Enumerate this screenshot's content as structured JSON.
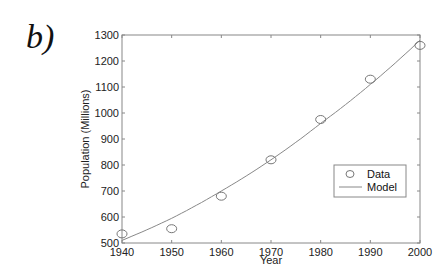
{
  "panel_label": "b)",
  "chart_data": {
    "type": "scatter",
    "title": "",
    "xlabel": "Year",
    "ylabel": "Population (Millions)",
    "xlim": [
      1940,
      2000
    ],
    "ylim": [
      500,
      1300
    ],
    "xticks": [
      1940,
      1950,
      1960,
      1970,
      1980,
      1990,
      2000
    ],
    "yticks": [
      500,
      600,
      700,
      800,
      900,
      1000,
      1100,
      1200,
      1300
    ],
    "grid": false,
    "legend_position": "lower right",
    "series": [
      {
        "name": "Data",
        "type": "scatter",
        "marker": "open-circle",
        "x": [
          1940,
          1950,
          1960,
          1970,
          1980,
          1990,
          2000
        ],
        "values": [
          535,
          555,
          680,
          820,
          975,
          1130,
          1260
        ]
      },
      {
        "name": "Model",
        "type": "line",
        "x": [
          1940,
          1950,
          1960,
          1970,
          1980,
          1990,
          2000
        ],
        "values": [
          510,
          595,
          700,
          820,
          960,
          1110,
          1280
        ]
      }
    ]
  },
  "legend": {
    "items": [
      {
        "label": "Data",
        "symbol": "circle"
      },
      {
        "label": "Model",
        "symbol": "line"
      }
    ]
  },
  "colors": {
    "axis": "#888888",
    "marker": "#777777",
    "line": "#888888",
    "text": "#222222"
  }
}
